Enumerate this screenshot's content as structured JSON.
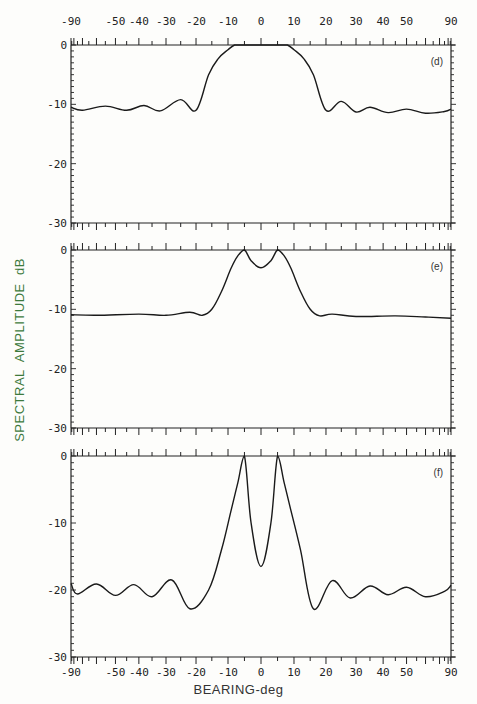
{
  "chart_data": {
    "type": "line",
    "xlabel": "BEARING-deg",
    "ylabel": "SPECTRAL  AMPLITUDE  dB",
    "x_scale": "sine-spaced bearing",
    "xlim": [
      -90,
      90
    ],
    "x_tick_labels": [
      "-90",
      "-50",
      "-40",
      "-30",
      "-20",
      "-10",
      "0",
      "10",
      "20",
      "30",
      "40",
      "50",
      "90"
    ],
    "x_tick_values": [
      -90,
      -50,
      -40,
      -30,
      -20,
      -10,
      0,
      10,
      20,
      30,
      40,
      50,
      90
    ],
    "grid": false,
    "panels": [
      {
        "tag": "(d)",
        "ylim": [
          -30,
          0
        ],
        "y_tick_labels": [
          "0",
          "-10",
          "-20",
          "-30"
        ],
        "y_tick_values": [
          0,
          -10,
          -20,
          -30
        ],
        "description": "single broad merged peak clipped at 0 dB from about -7 to +7 deg, sidelobes near -10 to -11 dB",
        "x": [
          -90,
          -70,
          -55,
          -45,
          -38,
          -32,
          -25,
          -20,
          -16,
          -13,
          -10,
          -8,
          -6,
          -4,
          0,
          4,
          6,
          8,
          10,
          13,
          16,
          20,
          25,
          30,
          35,
          42,
          50,
          60,
          75,
          90
        ],
        "y": [
          -10.5,
          -11,
          -10.3,
          -11,
          -10.2,
          -11.1,
          -9.2,
          -11.0,
          -5,
          -2.3,
          -0.8,
          0,
          0,
          0,
          0,
          0,
          0,
          0,
          -0.8,
          -2.3,
          -5,
          -11.0,
          -9.5,
          -11.3,
          -10.5,
          -11.4,
          -10.8,
          -11.5,
          -11.2,
          -10.8
        ]
      },
      {
        "tag": "(e)",
        "ylim": [
          -30,
          0
        ],
        "y_tick_labels": [
          "0",
          "-10",
          "-20",
          "-30"
        ],
        "y_tick_values": [
          0,
          -10,
          -20,
          -30
        ],
        "description": "two peaks at about -5 and +5 deg reaching 0 dB with a dip of about -3 dB between, floor near -11 dB",
        "x": [
          -90,
          -60,
          -40,
          -30,
          -22,
          -18,
          -15,
          -12,
          -9,
          -7,
          -5,
          -3,
          0,
          3,
          5,
          7,
          9,
          12,
          15,
          18,
          22,
          30,
          45,
          60,
          90
        ],
        "y": [
          -10.9,
          -11,
          -10.8,
          -11,
          -10.5,
          -11.0,
          -10,
          -7,
          -3,
          -1,
          0,
          -1.8,
          -3.0,
          -1.8,
          0,
          -1,
          -3,
          -7,
          -10,
          -11.1,
          -10.8,
          -11.2,
          -11.1,
          -11.3,
          -11.5
        ]
      },
      {
        "tag": "(f)",
        "ylim": [
          -30,
          0
        ],
        "y_tick_labels": [
          "0",
          "-10",
          "-20",
          "-30"
        ],
        "y_tick_values": [
          0,
          -10,
          -20,
          -30
        ],
        "description": "two sharp resolved peaks at about -5 and +5 deg reaching 0 dB, dip to about -16.5 dB at 0 deg, sidelobes near -19 to -23 dB",
        "x": [
          -90,
          -75,
          -60,
          -50,
          -42,
          -35,
          -28,
          -22,
          -16,
          -12,
          -9,
          -7,
          -5,
          -3,
          0,
          3,
          5,
          7,
          9,
          12,
          16,
          22,
          28,
          35,
          42,
          50,
          60,
          75,
          90
        ],
        "y": [
          -19,
          -20.6,
          -19.1,
          -20.8,
          -19.2,
          -21.0,
          -18.5,
          -22.8,
          -20,
          -14,
          -8,
          -4,
          0,
          -10,
          -16.5,
          -10,
          0,
          -4,
          -8,
          -14,
          -22.8,
          -18.6,
          -21.2,
          -19.4,
          -20.7,
          -19.6,
          -21.0,
          -20.2,
          -19.3
        ]
      }
    ]
  },
  "labels": {
    "x_axis_title": "BEARING-deg",
    "y_axis_title": "SPECTRAL  AMPLITUDE  dB"
  }
}
